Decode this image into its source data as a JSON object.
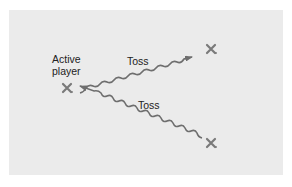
{
  "diagram": {
    "title": "",
    "background_color": "#ffffff",
    "panel_color": "#ebebeb",
    "line_color": "#6e6e6e",
    "marker_color": "#7a7a7a",
    "nodes": [
      {
        "id": "active",
        "label": "Active player",
        "marker": "x-icon",
        "x": 67,
        "y": 88
      },
      {
        "id": "target_top",
        "label": "",
        "marker": "x-icon",
        "x": 211,
        "y": 49
      },
      {
        "id": "target_bottom",
        "label": "",
        "marker": "x-icon",
        "x": 211,
        "y": 143
      }
    ],
    "edges": [
      {
        "from": "active",
        "to": "target_top",
        "label": "Toss",
        "style": "wavy-arrow"
      },
      {
        "from": "target_bottom",
        "to": "active",
        "label": "Toss",
        "style": "wavy-arrow"
      }
    ]
  },
  "labels": {
    "active_player_line1": "Active",
    "active_player_line2": "player",
    "toss_top": "Toss",
    "toss_bottom": "Toss"
  }
}
